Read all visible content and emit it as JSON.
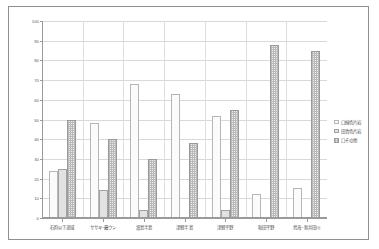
{
  "chart_data": {
    "type": "bar",
    "title": "",
    "subtitle": "",
    "xlabel": "",
    "ylabel": "",
    "ylim": [
      0,
      100
    ],
    "ytick_step": 10,
    "yticks": [
      0,
      10,
      20,
      30,
      40,
      50,
      60,
      70,
      80,
      90,
      100
    ],
    "grid": true,
    "legend_position": "right",
    "categories": [
      "石狩以下流域",
      "ササキ~最ウン",
      "渡島半島",
      "津軽半島",
      "津軽平野",
      "秋田平野",
      "鳥海~新井田川"
    ],
    "series": [
      {
        "name": "口緑色片岩",
        "values": [
          24,
          48,
          68,
          63,
          52,
          12,
          15
        ]
      },
      {
        "name": "田青色片岩",
        "values": [
          25,
          14,
          4,
          0,
          4,
          0,
          0
        ]
      },
      {
        "name": "口その他",
        "values": [
          50,
          40,
          30,
          38,
          55,
          88,
          85
        ]
      }
    ]
  },
  "legend": {
    "items": [
      {
        "label": "口緑色片岩",
        "style": "s0"
      },
      {
        "label": "田青色片岩",
        "style": "s1"
      },
      {
        "label": "口その他",
        "style": "s2"
      }
    ]
  },
  "axes": {
    "y_max_label": "100",
    "y_min_label": "0"
  }
}
